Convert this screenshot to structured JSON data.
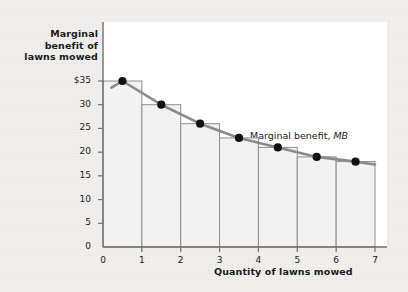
{
  "chart_data": {
    "type": "bar",
    "title": "",
    "xlabel": "Quantity of lawns mowed",
    "ylabel": "Marginal benefit of lawns mowed",
    "categories": [
      "1",
      "2",
      "3",
      "4",
      "5",
      "6",
      "7"
    ],
    "values": [
      35,
      30,
      26,
      23,
      21,
      19,
      18
    ],
    "x_points": [
      0.5,
      1.5,
      2.5,
      3.5,
      4.5,
      5.5,
      6.5
    ],
    "series": [
      {
        "name": "Marginal benefit, MB",
        "type": "line",
        "x": [
          0.5,
          1.5,
          2.5,
          3.5,
          4.5,
          5.5,
          6.5
        ],
        "values": [
          35,
          30,
          26,
          23,
          21,
          19,
          18
        ],
        "markers": true
      }
    ],
    "xlim": [
      0,
      7
    ],
    "ylim": [
      0,
      37
    ],
    "xticks": [
      0,
      1,
      2,
      3,
      4,
      5,
      6,
      7
    ],
    "yticks": [
      0,
      5,
      10,
      15,
      20,
      25,
      30,
      35
    ],
    "ytick_labels": [
      "0",
      "5",
      "10",
      "15",
      "20",
      "25",
      "30",
      "$35"
    ],
    "grid": false,
    "legend_position": "inside-right",
    "colors": {
      "bar_fill": "#f2f2f2",
      "bar_stroke": "#8d8d8d",
      "line": "#8a8a8a",
      "marker": "#111111",
      "axis": "#6f6f6f",
      "text": "#1a1a1a",
      "panel": "#ffffff",
      "figure_background": "#f1efed"
    }
  },
  "labels": {
    "y_axis_title": "Marginal benefit of lawns mowed",
    "y_axis_title_line1": "Marginal",
    "y_axis_title_line2": "benefit of",
    "y_axis_title_line3": "lawns mowed",
    "x_axis_title": "Quantity of lawns mowed",
    "series_label_text": "Marginal benefit, ",
    "series_label_italic": "MB"
  }
}
